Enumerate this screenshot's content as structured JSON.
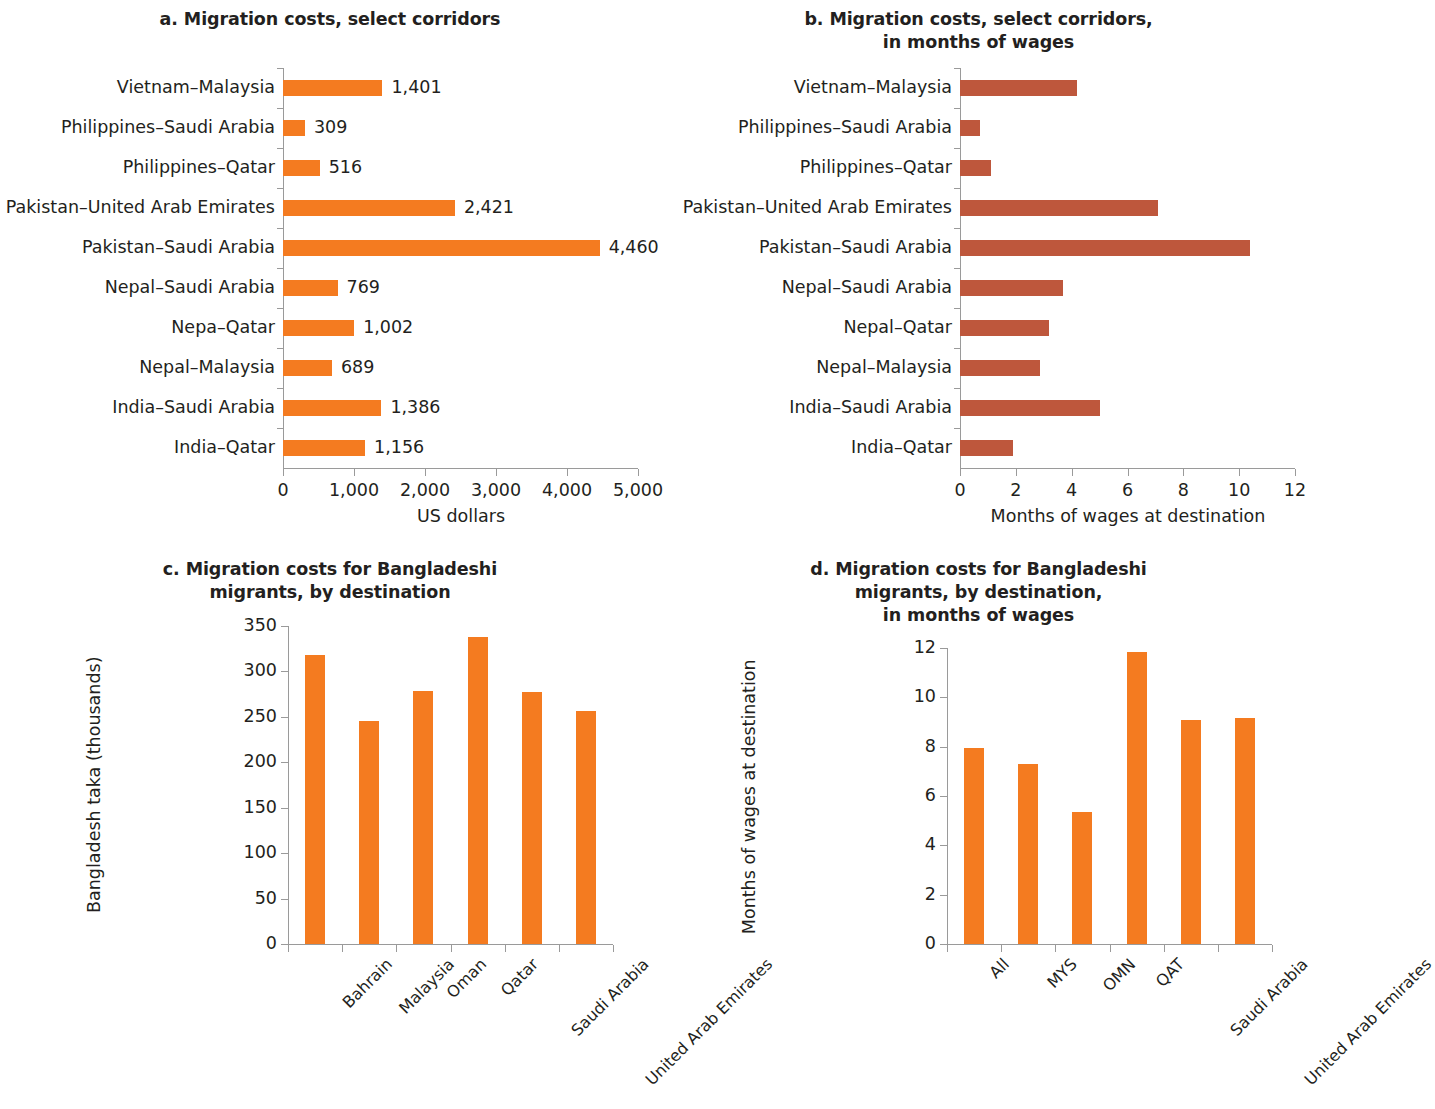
{
  "colors": {
    "orange": "#F47B20",
    "brown": "#BE573C",
    "axis": "#9a9a9a",
    "text": "#231f20"
  },
  "panels": {
    "a": {
      "title": "a. Migration costs, select corridors",
      "xlabel": "US dollars"
    },
    "b": {
      "title_line1": "b. Migration costs, select corridors,",
      "title_line2": "in months of wages",
      "xlabel": "Months of wages at destination"
    },
    "c": {
      "title_line1": "c. Migration costs for Bangladeshi",
      "title_line2": "migrants, by destination",
      "ylabel": "Bangladesh taka (thousands)"
    },
    "d": {
      "title_line1": "d. Migration costs for Bangladeshi",
      "title_line2": "migrants, by destination,",
      "title_line3": "in months of wages",
      "ylabel": "Months of wages at destination"
    }
  },
  "chart_data": [
    {
      "panel": "a",
      "type": "bar",
      "orientation": "horizontal",
      "title": "a. Migration costs, select corridors",
      "xlabel": "US dollars",
      "ylabel": "",
      "xlim": [
        0,
        5000
      ],
      "xticks": [
        0,
        1000,
        2000,
        3000,
        4000,
        5000
      ],
      "xticklabels": [
        "0",
        "1,000",
        "2,000",
        "3,000",
        "4,000",
        "5,000"
      ],
      "grid": false,
      "legend": "none",
      "color": "#F47B20",
      "categories": [
        "Vietnam–Malaysia",
        "Philippines–Saudi Arabia",
        "Philippines–Qatar",
        "Pakistan–United Arab Emirates",
        "Pakistan–Saudi Arabia",
        "Nepal–Saudi Arabia",
        "Nepa–Qatar",
        "Nepal–Malaysia",
        "India–Saudi Arabia",
        "India–Qatar"
      ],
      "values": [
        1401,
        309,
        516,
        2421,
        4460,
        769,
        1002,
        689,
        1386,
        1156
      ],
      "datalabels": [
        "1,401",
        "309",
        "516",
        "2,421",
        "4,460",
        "769",
        "1,002",
        "689",
        "1,386",
        "1,156"
      ]
    },
    {
      "panel": "b",
      "type": "bar",
      "orientation": "horizontal",
      "title": "b. Migration costs, select corridors, in months of wages",
      "xlabel": "Months of wages at destination",
      "ylabel": "",
      "xlim": [
        0,
        12
      ],
      "xticks": [
        0,
        2,
        4,
        6,
        8,
        10,
        12
      ],
      "xticklabels": [
        "0",
        "2",
        "4",
        "6",
        "8",
        "10",
        "12"
      ],
      "grid": false,
      "legend": "none",
      "color": "#BE573C",
      "categories": [
        "Vietnam–Malaysia",
        "Philippines–Saudi Arabia",
        "Philippines–Qatar",
        "Pakistan–United Arab Emirates",
        "Pakistan–Saudi Arabia",
        "Nepal–Saudi Arabia",
        "Nepal–Qatar",
        "Nepal–Malaysia",
        "India–Saudi Arabia",
        "India–Qatar"
      ],
      "values": [
        4.2,
        0.7,
        1.1,
        7.1,
        10.4,
        3.7,
        3.2,
        2.85,
        5.0,
        1.9
      ]
    },
    {
      "panel": "c",
      "type": "bar",
      "orientation": "vertical",
      "title": "c. Migration costs for Bangladeshi migrants, by destination",
      "xlabel": "",
      "ylabel": "Bangladesh taka (thousands)",
      "ylim": [
        0,
        350
      ],
      "yticks": [
        0,
        50,
        100,
        150,
        200,
        250,
        300,
        350
      ],
      "yticklabels": [
        "0",
        "50",
        "100",
        "150",
        "200",
        "250",
        "300",
        "350"
      ],
      "grid": false,
      "legend": "none",
      "color": "#F47B20",
      "categories": [
        "Bahrain",
        "Malaysia",
        "Oman",
        "Qatar",
        "Saudi Arabia",
        "United Arab Emirates"
      ],
      "values": [
        318,
        246,
        279,
        338,
        277,
        256
      ]
    },
    {
      "panel": "d",
      "type": "bar",
      "orientation": "vertical",
      "title": "d. Migration costs for Bangladeshi migrants, by destination, in months of wages",
      "xlabel": "",
      "ylabel": "Months of wages at destination",
      "ylim": [
        0,
        12
      ],
      "yticks": [
        0,
        2,
        4,
        6,
        8,
        10,
        12
      ],
      "yticklabels": [
        "0",
        "2",
        "4",
        "6",
        "8",
        "10",
        "12"
      ],
      "grid": false,
      "legend": "none",
      "color": "#F47B20",
      "categories": [
        "All",
        "MYS",
        "OMN",
        "QAT",
        "Saudi Arabia",
        "United Arab Emirates"
      ],
      "values": [
        7.95,
        7.3,
        5.35,
        11.85,
        9.1,
        9.15
      ]
    }
  ]
}
